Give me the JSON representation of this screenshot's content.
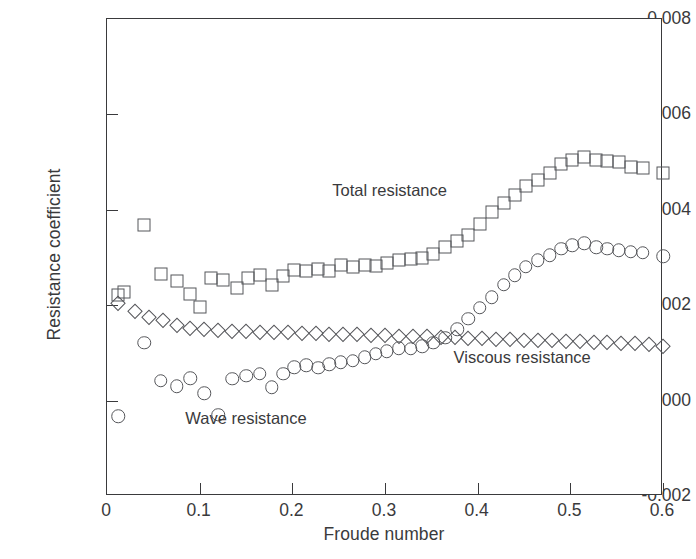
{
  "chart_data": {
    "type": "scatter",
    "title": "",
    "xlabel": "Froude number",
    "ylabel": "Resistance coefficient",
    "xlim": [
      0,
      0.6
    ],
    "ylim": [
      -0.002,
      0.008
    ],
    "xticks": [
      "0",
      "0.1",
      "0.2",
      "0.3",
      "0.4",
      "0.5",
      "0.6"
    ],
    "xtick_values": [
      0,
      0.1,
      0.2,
      0.3,
      0.4,
      0.5,
      0.6
    ],
    "yticks": [
      "-0.002",
      "0.000",
      "0.002",
      "0.004",
      "0.006",
      "0.008"
    ],
    "ytick_values": [
      -0.002,
      0.0,
      0.002,
      0.004,
      0.006,
      0.008
    ],
    "grid": false,
    "legend_position": "inline-annotations",
    "marker_color": "#55565a",
    "axis_color": "#3a3a3c",
    "series": [
      {
        "name": "Total resistance",
        "marker": "square",
        "label_x": 0.305,
        "label_y": 0.00442,
        "x": [
          0.012,
          0.018,
          0.04,
          0.058,
          0.075,
          0.09,
          0.1,
          0.112,
          0.125,
          0.14,
          0.152,
          0.165,
          0.178,
          0.19,
          0.202,
          0.215,
          0.228,
          0.24,
          0.252,
          0.265,
          0.278,
          0.29,
          0.302,
          0.315,
          0.328,
          0.34,
          0.352,
          0.365,
          0.378,
          0.39,
          0.402,
          0.415,
          0.428,
          0.44,
          0.452,
          0.465,
          0.478,
          0.49,
          0.502,
          0.515,
          0.528,
          0.54,
          0.552,
          0.565,
          0.578,
          0.6
        ],
        "values": [
          0.00222,
          0.00228,
          0.00368,
          0.00265,
          0.0025,
          0.00223,
          0.00196,
          0.00257,
          0.00252,
          0.00236,
          0.00258,
          0.00264,
          0.00243,
          0.00262,
          0.00274,
          0.00272,
          0.00276,
          0.00271,
          0.00284,
          0.0028,
          0.00284,
          0.00282,
          0.00288,
          0.00294,
          0.00296,
          0.003,
          0.00308,
          0.00321,
          0.00334,
          0.00347,
          0.0037,
          0.00396,
          0.00414,
          0.00432,
          0.0045,
          0.00463,
          0.00478,
          0.00497,
          0.00504,
          0.0051,
          0.00505,
          0.00503,
          0.005,
          0.0049,
          0.00487,
          0.00478
        ]
      },
      {
        "name": "Viscous resistance",
        "marker": "diamond",
        "label_x": 0.448,
        "label_y": 0.00092,
        "x": [
          0.012,
          0.03,
          0.045,
          0.06,
          0.075,
          0.09,
          0.105,
          0.12,
          0.135,
          0.15,
          0.165,
          0.18,
          0.195,
          0.21,
          0.225,
          0.24,
          0.255,
          0.27,
          0.285,
          0.3,
          0.315,
          0.33,
          0.345,
          0.36,
          0.375,
          0.39,
          0.405,
          0.42,
          0.435,
          0.45,
          0.465,
          0.48,
          0.495,
          0.51,
          0.525,
          0.54,
          0.555,
          0.57,
          0.585,
          0.6
        ],
        "values": [
          0.00205,
          0.00187,
          0.00176,
          0.00168,
          0.00158,
          0.00152,
          0.0015,
          0.00147,
          0.00146,
          0.00145,
          0.00144,
          0.00143,
          0.00143,
          0.00142,
          0.00142,
          0.0014,
          0.0014,
          0.00139,
          0.00138,
          0.00137,
          0.00136,
          0.00136,
          0.00135,
          0.00134,
          0.00133,
          0.00132,
          0.00131,
          0.0013,
          0.00129,
          0.00128,
          0.00127,
          0.00126,
          0.00125,
          0.00124,
          0.00123,
          0.00122,
          0.00121,
          0.0012,
          0.00119,
          0.00115
        ]
      },
      {
        "name": "Wave resistance",
        "marker": "circle",
        "label_x": 0.15,
        "label_y": -0.00036,
        "x": [
          0.012,
          0.04,
          0.058,
          0.075,
          0.09,
          0.105,
          0.12,
          0.135,
          0.15,
          0.165,
          0.178,
          0.19,
          0.202,
          0.215,
          0.228,
          0.24,
          0.252,
          0.265,
          0.278,
          0.29,
          0.302,
          0.315,
          0.328,
          0.34,
          0.352,
          0.365,
          0.378,
          0.39,
          0.402,
          0.415,
          0.428,
          0.44,
          0.452,
          0.465,
          0.478,
          0.49,
          0.502,
          0.515,
          0.528,
          0.54,
          0.552,
          0.565,
          0.578,
          0.6
        ],
        "values": [
          -0.00033,
          0.00121,
          0.00042,
          0.0003,
          0.00047,
          0.00015,
          -0.0003,
          0.00046,
          0.00052,
          0.00056,
          0.00028,
          0.00056,
          0.0007,
          0.00074,
          0.00069,
          0.00076,
          0.0008,
          0.00084,
          0.00091,
          0.00098,
          0.00103,
          0.0011,
          0.00109,
          0.00114,
          0.00121,
          0.00132,
          0.0015,
          0.00172,
          0.00195,
          0.00217,
          0.00243,
          0.00263,
          0.00281,
          0.00294,
          0.00305,
          0.00318,
          0.00326,
          0.0033,
          0.00322,
          0.00318,
          0.00315,
          0.00312,
          0.0031,
          0.00303
        ]
      }
    ]
  },
  "caption": {
    "text": ""
  }
}
